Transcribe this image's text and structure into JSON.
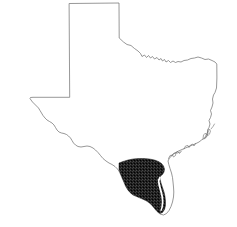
{
  "map": {
    "title": "Texas",
    "subject": "State of Texas outline map with South Texas region highlighted",
    "background_color": "#ffffff",
    "outline_color": "#6b6b6b",
    "highlight_color": "#1f1f1f",
    "width": 237,
    "height": 227,
    "highlighted_region": {
      "name": "South Texas",
      "label": "",
      "fill_style": "dense-dark-hatch",
      "color": "#1f1f1f"
    },
    "features": [
      {
        "name": "Panhandle",
        "label": ""
      },
      {
        "name": "Red River border",
        "label": ""
      },
      {
        "name": "Sabine River border",
        "label": ""
      },
      {
        "name": "Gulf Coast",
        "label": ""
      },
      {
        "name": "Rio Grande border",
        "label": ""
      },
      {
        "name": "Galveston Bay",
        "label": ""
      },
      {
        "name": "Matagorda Bay",
        "label": ""
      },
      {
        "name": "Corpus Christi Bay",
        "label": ""
      },
      {
        "name": "Laguna Madre",
        "label": ""
      },
      {
        "name": "Big Bend",
        "label": ""
      }
    ],
    "geometry": {
      "state_outline_path": "M 69.5,3.5 L 119.0,3.0 L 119.2,38.0 L 123.5,42.0 L 127.0,44.5 L 131.0,45.5 L 134.5,48.5 L 138.0,51.0 L 140.5,53.5 L 142.0,56.5 L 144.5,55.0 L 146.5,57.5 L 148.5,55.5 L 150.5,58.0 L 152.5,56.5 L 154.5,59.0 L 157.0,57.5 L 159.0,60.0 L 161.0,58.5 L 162.5,61.0 L 164.5,59.5 L 166.0,62.0 L 168.5,60.5 L 170.5,62.5 L 173.0,61.0 L 175.5,62.5 L 178.0,61.5 L 181.0,62.0 L 184.0,60.5 L 187.5,60.0 L 191.0,58.5 L 194.5,58.0 L 198.0,57.0 L 201.5,58.0 L 205.0,59.5 L 208.5,59.0 L 212.0,60.5 L 215.0,62.0 L 216.8,64.0 L 216.9,78.0 L 216.5,88.0 L 215.0,92.5 L 213.5,95.0 L 212.5,99.0 L 213.0,103.0 L 212.0,107.0 L 210.5,110.5 L 211.5,114.0 L 210.5,117.5 L 209.0,120.5 L 210.0,124.0 L 209.0,127.5 L 207.5,130.0 L 208.0,133.5 L 206.5,136.5 L 204.0,138.5 L 201.5,140.0 L 199.0,142.0 L 196.0,143.5 L 192.5,145.0 L 189.0,146.5 L 185.5,148.0 L 182.0,149.5 L 178.5,151.0 L 175.0,153.0 L 172.0,155.5 L 169.5,158.0 L 168.0,161.0 L 168.8,164.5 L 170.0,168.5 L 171.5,173.0 L 172.5,177.5 L 173.0,182.0 L 173.5,187.0 L 173.8,192.0 L 173.5,197.0 L 172.5,202.0 L 171.0,206.5 L 169.0,210.5 L 166.5,213.5 L 163.5,215.0 L 160.0,214.0 L 157.0,211.5 L 154.5,208.5 L 152.0,205.5 L 149.5,203.0 L 146.5,201.0 L 143.5,199.5 L 140.0,198.0 L 136.5,196.5 L 133.0,195.0 L 130.0,192.5 L 127.5,189.5 L 125.5,186.0 L 124.0,182.5 L 122.5,179.0 L 121.0,175.5 L 119.5,172.0 L 117.5,169.0 L 115.0,166.5 L 112.0,164.5 L 109.0,163.0 L 106.0,161.0 L 103.0,158.5 L 100.5,155.5 L 98.0,152.5 L 95.5,150.0 L 93.0,148.0 L 90.0,146.5 L 87.0,146.0 L 84.0,146.5 L 81.0,147.0 L 78.0,146.5 L 75.5,145.0 L 73.5,143.0 L 72.0,140.5 L 70.5,138.0 L 68.5,136.0 L 66.5,134.5 L 64.0,133.5 L 61.5,133.0 L 59.0,132.0 L 57.0,130.0 L 55.5,127.5 L 54.0,125.0 L 52.0,123.0 L 49.5,121.5 L 47.0,120.0 L 45.0,118.0 L 43.0,115.5 L 41.5,113.0 L 40.0,110.5 L 38.5,108.0 L 36.5,106.0 L 34.5,104.0 L 32.5,102.0 L 31.0,100.0 L 30.0,98.5 L 30.5,97.5 L 33.0,97.3 L 40.0,97.3 L 50.0,97.3 L 60.0,97.3 L 69.3,97.3 Z",
      "south_texas_path": "M 119.0,163.0 L 123.0,161.5 L 128.0,160.0 L 133.0,159.0 L 138.5,158.5 L 144.0,158.5 L 149.5,159.0 L 154.5,160.0 L 158.5,161.5 L 161.5,163.5 L 163.5,166.0 L 164.5,169.0 L 164.0,172.0 L 162.5,174.5 L 160.5,176.0 L 160.0,179.0 L 161.0,183.0 L 162.5,187.5 L 164.0,192.0 L 165.0,196.5 L 165.5,201.0 L 165.5,205.5 L 164.5,209.5 L 162.5,212.5 L 160.0,213.5 L 157.5,212.0 L 155.0,209.5 L 152.5,206.5 L 150.0,204.0 L 147.0,202.0 L 143.5,200.5 L 140.0,199.0 L 136.5,197.5 L 133.0,195.5 L 130.0,193.0 L 127.5,190.0 L 125.5,186.5 L 124.0,183.0 L 122.5,179.5 L 121.0,176.0 L 119.8,172.5 L 119.0,169.0 Z"
    }
  }
}
